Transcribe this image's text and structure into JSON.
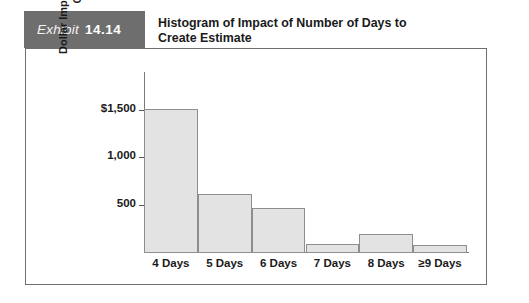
{
  "header": {
    "exhibit_word": "Exhibit",
    "exhibit_number": "14.14",
    "title_line1": "Histogram of Impact of Number of Days to",
    "title_line2": "Create Estimate"
  },
  "colors": {
    "tag_background": "#6e6e6e",
    "bar_fill": "#e3e3e3",
    "bar_border": "#8e8e8e",
    "frame_border": "#6f6f6f",
    "text": "#1a1a1a"
  },
  "chart_data": {
    "type": "bar",
    "title": "Histogram of Impact of Number of Days to Create Estimate",
    "xlabel": "",
    "ylabel_line1": "Dollar Impact of Number of Days to",
    "ylabel_line2": "Create Estimate",
    "categories": [
      "4 Days",
      "5 Days",
      "6 Days",
      "7 Days",
      "8 Days",
      "≥9 Days"
    ],
    "values": [
      1520,
      625,
      480,
      95,
      200,
      85
    ],
    "ytick_values": [
      500,
      1000,
      1500
    ],
    "ytick_labels": [
      "500",
      "1,000",
      "$1,500"
    ],
    "ylim": [
      0,
      1900
    ],
    "grid": false,
    "legend": false
  }
}
